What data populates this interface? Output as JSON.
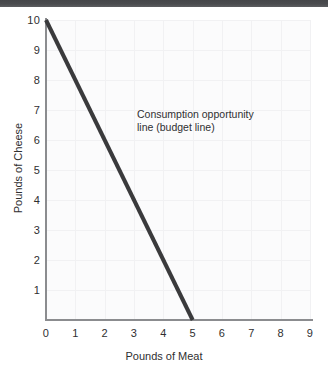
{
  "chart_data": {
    "type": "line",
    "title": "",
    "xlabel": "Pounds of Meat",
    "ylabel": "Pounds of Cheese",
    "xlim": [
      0,
      9
    ],
    "ylim": [
      0,
      10
    ],
    "xticks": [
      "0",
      "1",
      "2",
      "3",
      "4",
      "5",
      "6",
      "7",
      "8",
      "9"
    ],
    "yticks": [
      "1",
      "2",
      "3",
      "4",
      "5",
      "6",
      "7",
      "8",
      "9",
      "10"
    ],
    "grid": true,
    "legend": "none",
    "series": [
      {
        "name": "Consumption opportunity line (budget line)",
        "color": "#3a3a3c",
        "points": [
          {
            "x": 0,
            "y": 10
          },
          {
            "x": 5,
            "y": 0
          }
        ]
      }
    ],
    "annotations": [
      {
        "text": "Consumption opportunity\nline (budget line)",
        "x": 3.1,
        "y": 6.6
      }
    ]
  },
  "colors": {
    "line": "#3a3a3c",
    "axis": "#8b8c8f",
    "grid": "#f1f1f3",
    "plot_background": "#fbfbfc",
    "text": "#2f2f31",
    "top_band": "#4a4b4e"
  }
}
